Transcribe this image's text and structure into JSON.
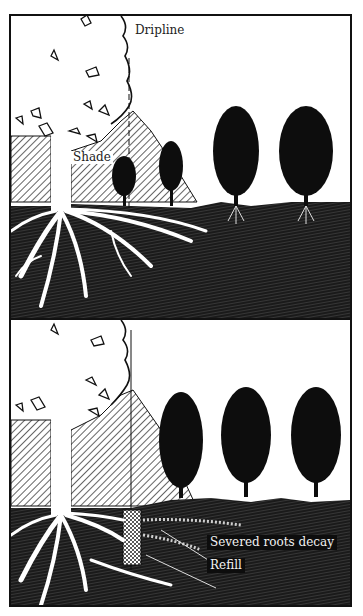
{
  "figure": {
    "panels": [
      {
        "id": "before",
        "labels": {
          "dripline": "Dripline",
          "shade": "Shade"
        }
      },
      {
        "id": "after",
        "labels": {
          "severed": "Severed roots decay",
          "refill": "Refill"
        }
      }
    ]
  },
  "colors": {
    "ink": "#111111",
    "paper": "#ffffff"
  }
}
